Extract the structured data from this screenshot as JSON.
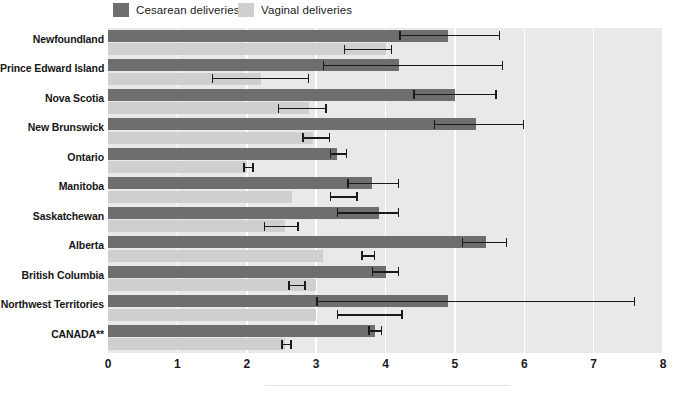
{
  "legend": {
    "items": [
      {
        "label": "Cesarean deliveries",
        "color": "#6e6e6e",
        "icon": "legend-swatch-icon"
      },
      {
        "label": "Vaginal deliveries",
        "color": "#cfcfcf",
        "icon": "legend-swatch-icon"
      }
    ]
  },
  "axis": {
    "ticks": [
      "0",
      "1",
      "2",
      "3",
      "4",
      "5",
      "6",
      "7",
      "8"
    ]
  },
  "chart_data": {
    "type": "bar",
    "orientation": "horizontal",
    "title": "",
    "xlabel": "",
    "ylabel": "",
    "xlim": [
      0,
      8
    ],
    "grid": true,
    "legend_position": "top",
    "categories": [
      "Newfoundland",
      "Prince Edward Island",
      "Nova Scotia",
      "New Brunswick",
      "Ontario",
      "Manitoba",
      "Saskatchewan",
      "Alberta",
      "British Columbia",
      "Northwest Territories",
      "CANADA**"
    ],
    "series": [
      {
        "name": "Cesarean deliveries",
        "color": "#6e6e6e",
        "values": [
          4.9,
          4.2,
          5.0,
          5.3,
          3.3,
          3.8,
          3.9,
          5.45,
          4.0,
          4.9,
          3.85
        ],
        "ci_low": [
          4.2,
          3.1,
          4.4,
          4.7,
          3.2,
          3.45,
          3.3,
          5.1,
          3.8,
          3.0,
          3.75
        ],
        "ci_high": [
          5.65,
          5.7,
          5.6,
          6.0,
          3.45,
          4.2,
          4.2,
          5.75,
          4.2,
          7.6,
          3.95
        ]
      },
      {
        "name": "Vaginal deliveries",
        "color": "#cfcfcf",
        "values": [
          4.0,
          2.2,
          2.9,
          2.95,
          2.0,
          2.65,
          2.55,
          3.1,
          3.0,
          3.0,
          2.55
        ],
        "ci_low": [
          3.4,
          1.5,
          2.45,
          2.8,
          1.95,
          3.2,
          2.25,
          3.65,
          2.6,
          3.3,
          2.5
        ],
        "ci_high": [
          4.1,
          2.9,
          3.15,
          3.2,
          2.1,
          3.6,
          2.75,
          3.85,
          2.85,
          4.25,
          2.65
        ]
      }
    ]
  }
}
